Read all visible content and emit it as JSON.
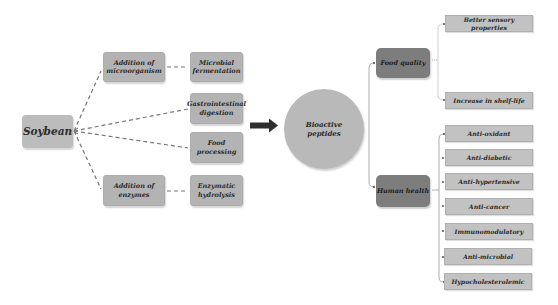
{
  "diagram": {
    "source": {
      "label": "Soybean"
    },
    "pathways": [
      {
        "method": "Addition of microorganism",
        "process": "Microbial fermentation"
      },
      {
        "method": null,
        "process": "Gastrointestinal digestion"
      },
      {
        "method": null,
        "process": "Food processing"
      },
      {
        "method": "Addition of enzymes",
        "process": "Enzymatic hydrolysis"
      }
    ],
    "product": {
      "label": "Bioactive peptides"
    },
    "categories": [
      {
        "label": "Food quality",
        "items": [
          "Better sensory properties",
          "Increase in shelf-life"
        ]
      },
      {
        "label": "Human health",
        "items": [
          "Anti-oxidant",
          "Anti-diabetic",
          "Anti-hypertensive",
          "Anti-cancer",
          "Immunomodulatory",
          "Anti-microbial",
          "Hypocholesterolemic"
        ]
      }
    ],
    "colors": {
      "box_light": "#b3b3b3",
      "box_dark": "#7d7d7d",
      "box_right": "#c2c2c2",
      "circle": "#b9b9b9",
      "arrow": "#2e2e2e",
      "connector": "#7a7a7a"
    }
  }
}
